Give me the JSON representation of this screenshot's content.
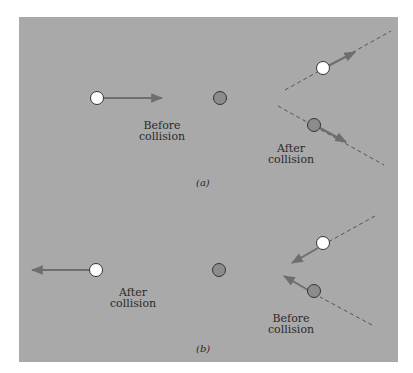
{
  "figure": {
    "colors": {
      "background": "#ffffff",
      "panel": "#a9a9a9",
      "arrow": "#6e6e6e",
      "dashed": "#555555",
      "light_ball": "#ffffff",
      "dark_ball": "#8c8c8c",
      "ball_outline": "#333333"
    },
    "panel_a": {
      "caption": "(a)",
      "label_before": [
        "Before",
        "collision"
      ],
      "label_after": [
        "After",
        "collision"
      ]
    },
    "panel_b": {
      "caption": "(b)",
      "label_after": [
        "After",
        "collision"
      ],
      "label_before": [
        "Before",
        "collision"
      ]
    }
  }
}
